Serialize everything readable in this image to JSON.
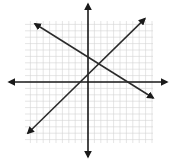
{
  "chart_data": {
    "type": "line",
    "title": "",
    "xlabel": "",
    "ylabel": "",
    "grid": true,
    "xlim": [
      -10,
      10
    ],
    "ylim": [
      -9.5,
      9.5
    ],
    "axes": {
      "x_axis_arrows": true,
      "y_axis_arrows": true
    },
    "series": [
      {
        "name": "line-decreasing",
        "slope": -0.63,
        "intercept": 3.9,
        "points": [
          [
            -8.3,
            9.1
          ],
          [
            10.2,
            -2.5
          ]
        ],
        "arrows_both_ends": true
      },
      {
        "name": "line-increasing",
        "slope": 0.97,
        "intercept": 1.3,
        "points": [
          [
            -9.4,
            -8.0
          ],
          [
            8.9,
            9.9
          ]
        ],
        "arrows_both_ends": true
      }
    ],
    "intersection": [
      1.4,
      2.9
    ]
  },
  "colors": {
    "grid": "#d4d4d4",
    "axis": "#1a1a1a",
    "line": "#2a2a2a",
    "background": "#ffffff"
  },
  "layout": {
    "origin_px": [
      88,
      82
    ],
    "unit_px": 6.4,
    "grid_px": {
      "left": 25,
      "top": 21,
      "right": 153,
      "bottom": 143
    },
    "x_axis_px": [
      9,
      167
    ],
    "y_axis_px": [
      4,
      157
    ]
  }
}
